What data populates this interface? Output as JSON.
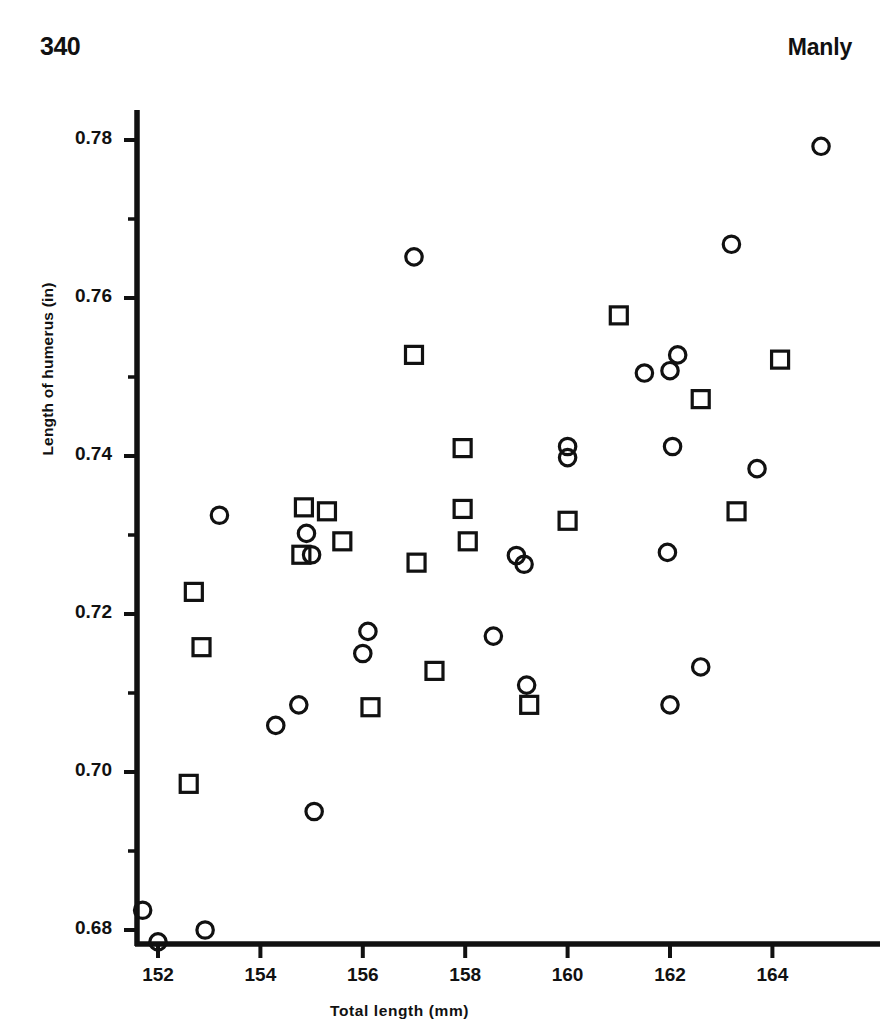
{
  "page": {
    "number": "340",
    "running_head": "Manly"
  },
  "chart_data": {
    "type": "scatter",
    "title": "",
    "xlabel": "Total  length  (mm)",
    "ylabel": "Length of humerus (in)",
    "xlim": [
      151.5,
      165.4
    ],
    "ylim": [
      0.6755,
      0.7855
    ],
    "xticks": [
      152,
      154,
      156,
      158,
      160,
      162,
      164
    ],
    "xticklabels": [
      "152",
      "154",
      "156",
      "158",
      "160",
      "162",
      "164"
    ],
    "yticks": [
      0.68,
      0.7,
      0.72,
      0.74,
      0.76,
      0.78
    ],
    "yticklabels": [
      "0.68",
      "0.70",
      "0.72",
      "0.74",
      "0.76",
      "0.78"
    ],
    "minor_xticks": [],
    "minor_yticks": [
      0.69,
      0.71,
      0.73,
      0.75,
      0.77
    ],
    "grid": false,
    "legend": null,
    "marker_color": "#111111",
    "series": [
      {
        "name": "circle-group",
        "marker": "circle",
        "points": [
          [
            151.7,
            0.6825
          ],
          [
            152.0,
            0.6785
          ],
          [
            152.92,
            0.68
          ],
          [
            153.2,
            0.7325
          ],
          [
            154.3,
            0.7059
          ],
          [
            154.9,
            0.7302
          ],
          [
            155.0,
            0.7275
          ],
          [
            154.75,
            0.7085
          ],
          [
            155.05,
            0.695
          ],
          [
            156.0,
            0.715
          ],
          [
            156.1,
            0.7178
          ],
          [
            157.0,
            0.7652
          ],
          [
            158.55,
            0.7172
          ],
          [
            159.0,
            0.7274
          ],
          [
            159.15,
            0.7263
          ],
          [
            159.2,
            0.711
          ],
          [
            160.0,
            0.7412
          ],
          [
            160.0,
            0.7398
          ],
          [
            161.5,
            0.7505
          ],
          [
            162.0,
            0.7508
          ],
          [
            162.15,
            0.7528
          ],
          [
            162.05,
            0.7412
          ],
          [
            161.95,
            0.7278
          ],
          [
            162.0,
            0.7085
          ],
          [
            162.6,
            0.7133
          ],
          [
            163.2,
            0.7668
          ],
          [
            163.7,
            0.7384
          ],
          [
            164.95,
            0.7792
          ]
        ]
      },
      {
        "name": "square-group",
        "marker": "square",
        "points": [
          [
            152.7,
            0.7228
          ],
          [
            152.85,
            0.7158
          ],
          [
            152.6,
            0.6985
          ],
          [
            154.8,
            0.7275
          ],
          [
            154.85,
            0.7335
          ],
          [
            155.3,
            0.733
          ],
          [
            155.6,
            0.7292
          ],
          [
            156.15,
            0.7082
          ],
          [
            157.0,
            0.7528
          ],
          [
            157.05,
            0.7265
          ],
          [
            157.4,
            0.7128
          ],
          [
            157.95,
            0.741
          ],
          [
            157.95,
            0.7333
          ],
          [
            158.05,
            0.7292
          ],
          [
            159.25,
            0.7085
          ],
          [
            160.0,
            0.7318
          ],
          [
            161.0,
            0.7578
          ],
          [
            162.6,
            0.7472
          ],
          [
            163.3,
            0.733
          ],
          [
            164.15,
            0.7522
          ]
        ]
      }
    ]
  }
}
